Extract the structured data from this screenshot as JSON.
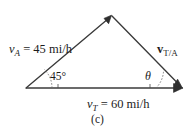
{
  "figure": {
    "caption": "(c)",
    "background_color": "#ffffff",
    "stroke_color": "#3a3a3a",
    "text_color": "#1c1c1c"
  },
  "labels": {
    "v_a": {
      "symbol": "v",
      "subscript": "A",
      "equals": " = 45 mi/h",
      "full_text": "v_A = 45 mi/h",
      "value": 45,
      "units": "mi/h"
    },
    "v_t": {
      "symbol": "v",
      "subscript": "T",
      "equals": " = 60 mi/h",
      "full_text": "v_T = 60 mi/h",
      "value": 60,
      "units": "mi/h"
    },
    "v_ta": {
      "symbol": "v",
      "subscript": "T/A",
      "full_text": "v_T/A",
      "bold": true
    },
    "angle_left": {
      "text": "45°",
      "value": 45,
      "units": "degrees"
    },
    "angle_right": {
      "text": "θ",
      "name": "theta",
      "units": "degrees"
    }
  },
  "geometry": {
    "vertex_left": {
      "x": 26,
      "y": 88
    },
    "vertex_apex": {
      "x": 111,
      "y": 16
    },
    "vertex_right": {
      "x": 182,
      "y": 88
    },
    "vectors": [
      {
        "name": "v_A",
        "from": "vertex_left",
        "to": "vertex_apex",
        "arrow_at": "to"
      },
      {
        "name": "v_T",
        "from": "vertex_left",
        "to": "vertex_right",
        "arrow_at": "to"
      },
      {
        "name": "v_TA",
        "from": "vertex_apex",
        "to": "vertex_right",
        "arrow_at": "to"
      }
    ]
  }
}
